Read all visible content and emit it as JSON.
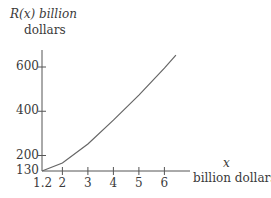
{
  "chart_data": {
    "type": "line",
    "title": "",
    "ylabel_line1": "R(x) billion",
    "ylabel_line2": "dollars",
    "xlabel_line1": "x",
    "xlabel_line2": "billion dollars",
    "x_ticks": [
      "1.2",
      "2",
      "3",
      "4",
      "5",
      "6"
    ],
    "y_ticks": [
      "130",
      "200",
      "400",
      "600"
    ],
    "xlim": [
      1.2,
      6.6
    ],
    "ylim": [
      130,
      660
    ],
    "grid": false,
    "series": [
      {
        "name": "R(x)",
        "x": [
          1.2,
          2,
          3,
          4,
          5,
          6,
          6.45
        ],
        "y": [
          130,
          166,
          252,
          360,
          473,
          595,
          654
        ]
      }
    ],
    "line_color": "#666666"
  }
}
